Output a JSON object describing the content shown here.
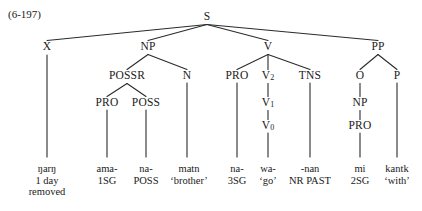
{
  "figure": {
    "example_number": "(6-197)",
    "width": 422,
    "height": 211,
    "ink_color": "#2b2b2b",
    "background_color": "#ffffff"
  },
  "tree": {
    "nodes": [
      {
        "id": "S",
        "label": "S",
        "x": 207,
        "y": 17
      },
      {
        "id": "X",
        "label": "X",
        "x": 47,
        "y": 47
      },
      {
        "id": "NP",
        "label": "NP",
        "x": 148,
        "y": 47
      },
      {
        "id": "V",
        "label": "V",
        "x": 268,
        "y": 47
      },
      {
        "id": "PP",
        "label": "PP",
        "x": 378,
        "y": 47
      },
      {
        "id": "POSSR",
        "label": "POSSR",
        "x": 127,
        "y": 76
      },
      {
        "id": "N",
        "label": "N",
        "x": 187,
        "y": 76
      },
      {
        "id": "PRO1",
        "label": "PRO",
        "x": 237,
        "y": 76
      },
      {
        "id": "V2",
        "label": "V",
        "sub": "2",
        "x": 268,
        "y": 76
      },
      {
        "id": "TNS",
        "label": "TNS",
        "x": 310,
        "y": 76
      },
      {
        "id": "O",
        "label": "O",
        "x": 360,
        "y": 76
      },
      {
        "id": "P",
        "label": "P",
        "x": 397,
        "y": 76
      },
      {
        "id": "PRO2",
        "label": "PRO",
        "x": 107,
        "y": 103
      },
      {
        "id": "POSS",
        "label": "POSS",
        "x": 146,
        "y": 103
      },
      {
        "id": "V1",
        "label": "V",
        "sub": "1",
        "x": 268,
        "y": 103
      },
      {
        "id": "NP2",
        "label": "NP",
        "x": 360,
        "y": 103
      },
      {
        "id": "V0",
        "label": "V",
        "sub": "0",
        "x": 268,
        "y": 126
      },
      {
        "id": "PRO3",
        "label": "PRO",
        "x": 360,
        "y": 126
      }
    ],
    "edges": [
      {
        "from": "S",
        "to": "X"
      },
      {
        "from": "S",
        "to": "NP"
      },
      {
        "from": "S",
        "to": "V"
      },
      {
        "from": "S",
        "to": "PP"
      },
      {
        "from": "NP",
        "to": "POSSR"
      },
      {
        "from": "NP",
        "to": "N"
      },
      {
        "from": "V",
        "to": "PRO1"
      },
      {
        "from": "V",
        "to": "V2"
      },
      {
        "from": "V",
        "to": "TNS"
      },
      {
        "from": "PP",
        "to": "O"
      },
      {
        "from": "PP",
        "to": "P"
      },
      {
        "from": "POSSR",
        "to": "PRO2"
      },
      {
        "from": "POSSR",
        "to": "POSS"
      },
      {
        "from": "V2",
        "to": "V1"
      },
      {
        "from": "V1",
        "to": "V0"
      },
      {
        "from": "O",
        "to": "NP2"
      },
      {
        "from": "NP2",
        "to": "PRO3"
      }
    ],
    "leaf_stems": [
      {
        "from": "X",
        "x": 47,
        "y1": 55,
        "y2": 157
      },
      {
        "from": "PRO2",
        "x": 107,
        "y1": 110,
        "y2": 157
      },
      {
        "from": "POSS",
        "x": 146,
        "y1": 110,
        "y2": 157
      },
      {
        "from": "N",
        "x": 187,
        "y1": 83,
        "y2": 157
      },
      {
        "from": "PRO1",
        "x": 237,
        "y1": 83,
        "y2": 157
      },
      {
        "from": "V0",
        "x": 268,
        "y1": 133,
        "y2": 157
      },
      {
        "from": "TNS",
        "x": 310,
        "y1": 83,
        "y2": 157
      },
      {
        "from": "PRO3",
        "x": 360,
        "y1": 133,
        "y2": 157
      },
      {
        "from": "P",
        "x": 397,
        "y1": 83,
        "y2": 157
      }
    ],
    "leaves": [
      {
        "id": "leaf-x",
        "x": 47,
        "y": 163,
        "lines": [
          "ŋarŋ",
          "1 day",
          "removed"
        ]
      },
      {
        "id": "leaf-pro1",
        "x": 107,
        "y": 163,
        "lines": [
          "ama-",
          "1SG"
        ]
      },
      {
        "id": "leaf-poss",
        "x": 146,
        "y": 163,
        "lines": [
          "na-",
          "POSS"
        ]
      },
      {
        "id": "leaf-n",
        "x": 189,
        "y": 163,
        "lines": [
          "matn",
          "‘brother’"
        ]
      },
      {
        "id": "leaf-pro2",
        "x": 237,
        "y": 163,
        "lines": [
          "na-",
          "3SG"
        ]
      },
      {
        "id": "leaf-v0",
        "x": 268,
        "y": 163,
        "lines": [
          "wa-",
          "‘go’"
        ]
      },
      {
        "id": "leaf-tns",
        "x": 310,
        "y": 163,
        "lines": [
          "-nan",
          "NR PAST"
        ]
      },
      {
        "id": "leaf-pro3",
        "x": 360,
        "y": 163,
        "lines": [
          "mi",
          "2SG"
        ]
      },
      {
        "id": "leaf-p",
        "x": 397,
        "y": 163,
        "lines": [
          "kantk",
          "‘with’"
        ]
      }
    ]
  }
}
